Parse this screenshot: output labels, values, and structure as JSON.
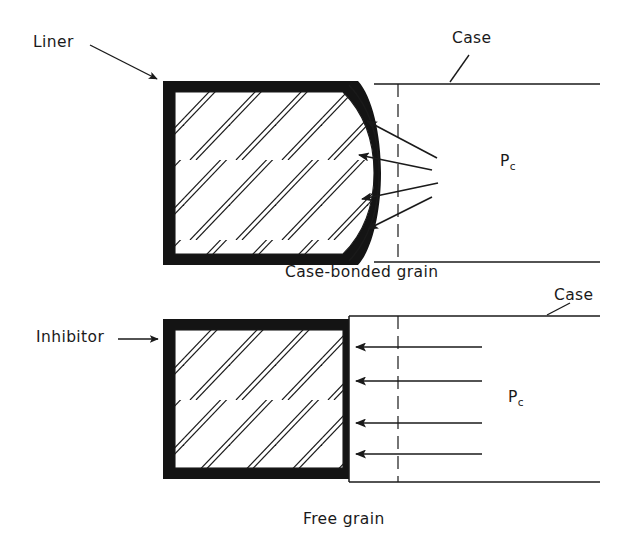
{
  "figure": {
    "type": "engineering-cross-section-diagram",
    "background_color": "#ffffff",
    "line_color": "#1a1a1a",
    "fill_color": "#141414"
  },
  "panels": [
    {
      "id": "case-bonded",
      "caption": "Case-bonded grain",
      "labels": [
        {
          "name": "liner",
          "text": "Liner"
        },
        {
          "name": "case",
          "text": "Case"
        },
        {
          "name": "chamber-pressure",
          "text": "P",
          "subscript": "c"
        }
      ],
      "bore_shape": "convex-arc",
      "arrow_count": 4,
      "arrow_style": "converging-slanted",
      "centerline_style": "dashed"
    },
    {
      "id": "free-grain",
      "caption": "Free grain",
      "labels": [
        {
          "name": "inhibitor",
          "text": "Inhibitor"
        },
        {
          "name": "case",
          "text": "Case"
        },
        {
          "name": "chamber-pressure",
          "text": "P",
          "subscript": "c"
        }
      ],
      "bore_shape": "flat-vertical",
      "arrow_count": 4,
      "arrow_style": "horizontal-parallel",
      "centerline_style": "dashed"
    }
  ],
  "texts": {
    "liner": "Liner",
    "case_top": "Case",
    "case_bottom": "Case",
    "inhibitor": "Inhibitor",
    "pc_symbol": "P",
    "pc_subscript": "c",
    "caption_top": "Case-bonded grain",
    "caption_bottom": "Free grain"
  }
}
